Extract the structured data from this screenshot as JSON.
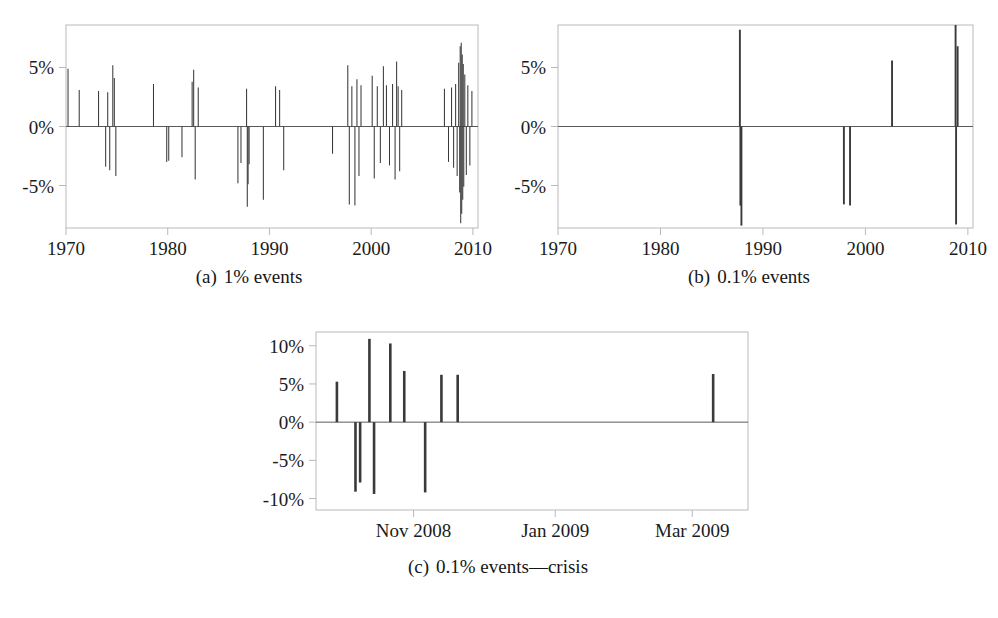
{
  "figure": {
    "background": "#ffffff",
    "ink": "#1a1a1a",
    "panel_frame_color": "#b9b9b9",
    "spike_color": "#3a3a3a",
    "zero_line_color": "#5a5a5a"
  },
  "panels": [
    {
      "id": "panel-a",
      "caption_tag": "(a)",
      "caption_text": "1% events",
      "caption_full": "(a)  1% events"
    },
    {
      "id": "panel-b",
      "caption_tag": "(b)",
      "caption_text": "0.1% events",
      "caption_full": "(b)  0.1% events"
    },
    {
      "id": "panel-c",
      "caption_tag": "(c)",
      "caption_text": "0.1% events—crisis",
      "caption_full": "(c)  0.1% events—crisis"
    }
  ],
  "chart_data": [
    {
      "type": "bar",
      "id": "panel-a",
      "title": "(a)  1% events",
      "xlabel": "",
      "ylabel": "",
      "xlim": [
        1970,
        2010.5
      ],
      "ylim": [
        -8.6,
        8.6
      ],
      "xticks": [
        1970,
        1980,
        1990,
        2000,
        2010
      ],
      "xtick_labels": [
        "1970",
        "1980",
        "1990",
        "2000",
        "2010"
      ],
      "yticks": [
        -5,
        0,
        5
      ],
      "ytick_labels": [
        "-5%",
        "0%",
        "5%"
      ],
      "grid": false,
      "legend": "none",
      "x": [
        1970.2,
        1971.3,
        1973.2,
        1973.9,
        1974.1,
        1974.3,
        1974.6,
        1974.75,
        1974.9,
        1978.6,
        1979.9,
        1980.1,
        1981.4,
        1982.4,
        1982.55,
        1982.7,
        1983.0,
        1986.9,
        1987.2,
        1987.75,
        1987.82,
        1987.9,
        1988.0,
        1989.4,
        1990.6,
        1991.0,
        1991.4,
        1996.2,
        1997.7,
        1997.85,
        1998.1,
        1998.4,
        1998.6,
        1998.8,
        1999.0,
        2000.1,
        2000.3,
        2000.6,
        2000.9,
        2001.2,
        2001.5,
        2001.8,
        2002.1,
        2002.35,
        2002.5,
        2002.65,
        2002.8,
        2003.0,
        2007.2,
        2007.6,
        2007.9,
        2008.1,
        2008.3,
        2008.45,
        2008.6,
        2008.7,
        2008.75,
        2008.8,
        2008.85,
        2008.9,
        2008.95,
        2009.0,
        2009.05,
        2009.1,
        2009.2,
        2009.35,
        2009.5,
        2009.7,
        2009.9
      ],
      "values": [
        4.9,
        3.1,
        3.0,
        -3.4,
        2.9,
        -3.7,
        5.2,
        4.1,
        -4.2,
        3.6,
        -3.0,
        -2.9,
        -2.6,
        3.8,
        4.8,
        -4.5,
        3.3,
        -4.8,
        -3.1,
        3.2,
        -6.8,
        -4.9,
        -3.2,
        -6.2,
        3.4,
        3.1,
        -3.7,
        -2.3,
        5.2,
        -6.6,
        3.4,
        -6.7,
        4.0,
        -4.2,
        3.5,
        4.3,
        -4.4,
        3.4,
        -3.1,
        5.1,
        3.5,
        -3.3,
        3.6,
        -4.5,
        5.5,
        3.4,
        -3.8,
        3.1,
        3.2,
        -3.0,
        3.3,
        -3.5,
        3.6,
        -4.2,
        5.4,
        -5.6,
        6.8,
        -8.2,
        7.1,
        -7.4,
        6.1,
        -6.2,
        5.3,
        -5.1,
        4.4,
        -4.1,
        3.5,
        -3.3,
        3.0
      ],
      "description": "Daily return spikes exceeding the 1% tail threshold, 1970-2010. Dense clustering in 1974, 1987, 1998, 2000-2002 and an extreme cluster in 2008-2009."
    },
    {
      "type": "bar",
      "id": "panel-b",
      "title": "(b)  0.1% events",
      "xlabel": "",
      "ylabel": "",
      "xlim": [
        1970,
        2010.5
      ],
      "ylim": [
        -8.6,
        8.6
      ],
      "xticks": [
        1970,
        1980,
        1990,
        2000,
        2010
      ],
      "xtick_labels": [
        "1970",
        "1980",
        "1990",
        "2000",
        "2010"
      ],
      "yticks": [
        -5,
        0,
        5
      ],
      "ytick_labels": [
        "-5%",
        "0%",
        "5%"
      ],
      "grid": false,
      "legend": "none",
      "x": [
        1987.75,
        1987.8,
        1987.9,
        1997.9,
        1998.5,
        2002.6,
        2008.8,
        2008.85,
        2009.0
      ],
      "values": [
        8.2,
        -6.7,
        -8.4,
        -6.6,
        -6.7,
        5.6,
        8.6,
        -8.3,
        6.8
      ],
      "description": "Daily return spikes exceeding the 0.1% tail threshold, 1970-2010. Only the October 1987 crash, 1997-1998, 2002 and the 2008-2009 crisis qualify."
    },
    {
      "type": "bar",
      "id": "panel-c",
      "title": "(c)  0.1% events—crisis",
      "xlabel": "",
      "ylabel": "",
      "xlim": [
        "2008-09-20",
        "2009-03-25"
      ],
      "xticks": [
        "Nov 2008",
        "Jan 2009",
        "Mar 2009"
      ],
      "xtick_labels": [
        "Nov 2008",
        "Jan 2009",
        "Mar 2009"
      ],
      "ylim": [
        -11.5,
        11.8
      ],
      "yticks": [
        -10,
        -5,
        0,
        5,
        10
      ],
      "ytick_labels": [
        "-10%",
        "-5%",
        "0%",
        "5%",
        "10%"
      ],
      "grid": false,
      "legend": "none",
      "x": [
        "2008-09-29",
        "2008-10-07",
        "2008-10-09",
        "2008-10-13",
        "2008-10-15",
        "2008-10-22",
        "2008-10-28",
        "2008-11-06",
        "2008-11-13",
        "2008-11-20",
        "2009-03-10"
      ],
      "values": [
        5.3,
        -9.1,
        -7.9,
        10.9,
        -9.4,
        10.3,
        6.7,
        -9.2,
        6.2,
        6.2,
        6.3
      ],
      "description": "Daily return spikes exceeding the 0.1% tail threshold during the 2008-2009 financial crisis window, late Sep 2008 through Mar 2009."
    }
  ]
}
